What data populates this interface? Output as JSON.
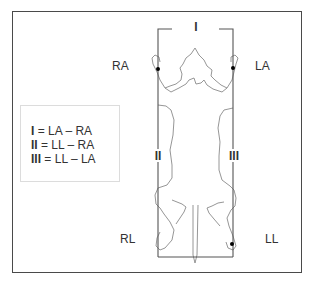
{
  "diagram": {
    "electrodes": {
      "ra": "RA",
      "la": "LA",
      "rl": "RL",
      "ll": "LL"
    },
    "leads": {
      "lead_1": "I",
      "lead_2": "II",
      "lead_3": "III"
    },
    "legend": [
      {
        "lead": "I",
        "formula": "= LA – RA"
      },
      {
        "lead": "II",
        "formula": "= LL – RA"
      },
      {
        "lead": "III",
        "formula": "= LL – LA"
      }
    ],
    "colors": {
      "frame": "#4a4a4a",
      "wire": "#555555",
      "outline": "#8a8a8a",
      "electrode_dot": "#000000",
      "text": "#333333"
    }
  }
}
